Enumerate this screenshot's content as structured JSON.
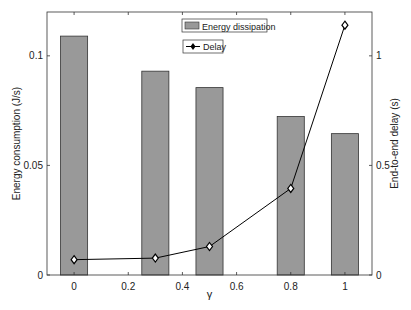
{
  "chart_data": {
    "type": "bar+line",
    "title": "",
    "xlabel": "γ",
    "ylabel_left": "Energy consumption (J/s)",
    "ylabel_right": "End-to-end delay (s)",
    "x_ticks": [
      "0",
      "0.2",
      "0.4",
      "0.6",
      "0.8",
      "1"
    ],
    "y_left_ticks": [
      "0",
      "0.05",
      "0.1"
    ],
    "y_right_ticks": [
      "0",
      "0.5",
      "1"
    ],
    "xlim": [
      -0.1,
      1.1
    ],
    "ylim_left": [
      0,
      0.12
    ],
    "ylim_right": [
      0,
      1.2
    ],
    "grid": false,
    "legend_position": "top-center",
    "series": [
      {
        "name": "Energy dissipation",
        "type": "bar",
        "axis": "left",
        "color": "#999999",
        "x": [
          0,
          0.3,
          0.5,
          0.8,
          1
        ],
        "values": [
          0.109,
          0.093,
          0.0855,
          0.0723,
          0.0645
        ]
      },
      {
        "name": "Delay",
        "type": "line",
        "axis": "right",
        "marker": "diamond",
        "color": "#000000",
        "x": [
          0,
          0.3,
          0.5,
          0.8,
          1
        ],
        "values": [
          0.07,
          0.077,
          0.13,
          0.395,
          1.14
        ]
      }
    ]
  }
}
